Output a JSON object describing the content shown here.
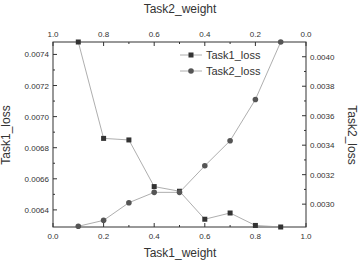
{
  "chart_data": {
    "type": "line",
    "title": "",
    "xlabel": "Task1_weight",
    "x2label": "Task2_weight",
    "ylabel": "Task1_loss",
    "y2label": "Task2_loss",
    "x": [
      0.1,
      0.2,
      0.3,
      0.4,
      0.5,
      0.6,
      0.7,
      0.8,
      0.9
    ],
    "xlim": [
      0.0,
      1.0
    ],
    "x2lim": [
      1.0,
      0.0
    ],
    "ylim": [
      0.00629,
      0.00748
    ],
    "y2lim": [
      0.002845,
      0.0041
    ],
    "xticks": [
      "0.0",
      "0.2",
      "0.4",
      "0.6",
      "0.8",
      "1.0"
    ],
    "x2ticks": [
      "1.0",
      "0.8",
      "0.6",
      "0.4",
      "0.2",
      "0.0"
    ],
    "yticks": [
      "0.0064",
      "0.0066",
      "0.0068",
      "0.0070",
      "0.0072",
      "0.0074"
    ],
    "y2ticks": [
      "0.0030",
      "0.0032",
      "0.0034",
      "0.0036",
      "0.0038",
      "0.0040"
    ],
    "series": [
      {
        "name": "Task1_loss",
        "axis": "left",
        "marker": "square",
        "values": [
          0.00748,
          0.00686,
          0.00685,
          0.00655,
          0.00652,
          0.00634,
          0.00638,
          0.0063,
          0.00629
        ]
      },
      {
        "name": "Task2_loss",
        "axis": "right",
        "marker": "circle",
        "values": [
          0.00285,
          0.00289,
          0.00301,
          0.00308,
          0.00308,
          0.00326,
          0.00343,
          0.00371,
          0.0041
        ]
      }
    ],
    "legend_position": "upper right",
    "grid": false
  }
}
